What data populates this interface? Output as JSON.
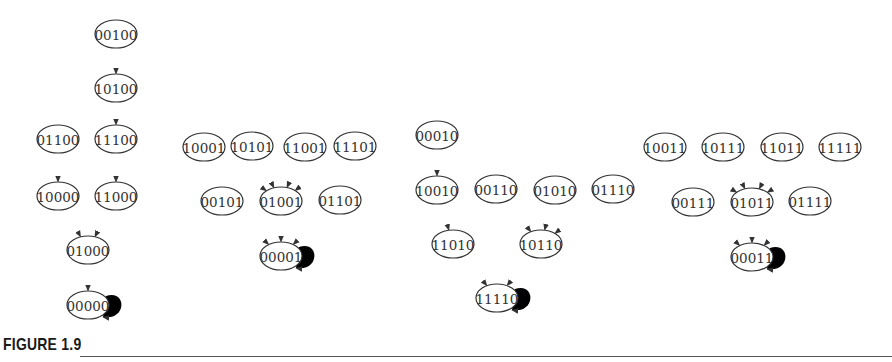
{
  "figure": {
    "caption": "FIGURE 1.9",
    "node_rx": 21,
    "node_ry": 14,
    "stroke_color": "#333333"
  },
  "graphs": [
    {
      "id": "g1",
      "attractor": "00000",
      "nodes": [
        {
          "id": "00100",
          "x": 116,
          "y": 34
        },
        {
          "id": "10100",
          "x": 116,
          "y": 88
        },
        {
          "id": "01100",
          "x": 58,
          "y": 139
        },
        {
          "id": "11100",
          "x": 116,
          "y": 139
        },
        {
          "id": "10000",
          "x": 58,
          "y": 196
        },
        {
          "id": "11000",
          "x": 116,
          "y": 196
        },
        {
          "id": "01000",
          "x": 88,
          "y": 250
        },
        {
          "id": "00000",
          "x": 88,
          "y": 305
        }
      ],
      "edges": [
        [
          "00100",
          "10100"
        ],
        [
          "10100",
          "11100"
        ],
        [
          "01100",
          "10000"
        ],
        [
          "11100",
          "11000"
        ],
        [
          "10000",
          "01000"
        ],
        [
          "11000",
          "01000"
        ],
        [
          "01000",
          "00000"
        ],
        [
          "00000",
          "00000"
        ]
      ]
    },
    {
      "id": "g2",
      "attractor": "00001",
      "nodes": [
        {
          "id": "10001",
          "x": 204,
          "y": 147
        },
        {
          "id": "10101",
          "x": 252,
          "y": 146
        },
        {
          "id": "11001",
          "x": 305,
          "y": 147
        },
        {
          "id": "11101",
          "x": 355,
          "y": 146
        },
        {
          "id": "00101",
          "x": 222,
          "y": 201
        },
        {
          "id": "01001",
          "x": 281,
          "y": 201
        },
        {
          "id": "01101",
          "x": 340,
          "y": 200
        },
        {
          "id": "00001",
          "x": 281,
          "y": 256
        }
      ],
      "edges": [
        [
          "10001",
          "01001"
        ],
        [
          "10101",
          "01001"
        ],
        [
          "11001",
          "01001"
        ],
        [
          "11101",
          "01001"
        ],
        [
          "00101",
          "00001"
        ],
        [
          "01001",
          "00001"
        ],
        [
          "01101",
          "00001"
        ],
        [
          "00001",
          "00001"
        ]
      ]
    },
    {
      "id": "g3",
      "attractor": "11110",
      "nodes": [
        {
          "id": "00010",
          "x": 437,
          "y": 135
        },
        {
          "id": "10010",
          "x": 437,
          "y": 190
        },
        {
          "id": "00110",
          "x": 496,
          "y": 189
        },
        {
          "id": "01010",
          "x": 555,
          "y": 190
        },
        {
          "id": "01110",
          "x": 613,
          "y": 189
        },
        {
          "id": "11010",
          "x": 453,
          "y": 244
        },
        {
          "id": "10110",
          "x": 541,
          "y": 244
        },
        {
          "id": "11110",
          "x": 497,
          "y": 298
        }
      ],
      "edges": [
        [
          "00010",
          "10010"
        ],
        [
          "10010",
          "11010"
        ],
        [
          "00110",
          "10110"
        ],
        [
          "01010",
          "10110"
        ],
        [
          "01110",
          "10110"
        ],
        [
          "11010",
          "11110"
        ],
        [
          "10110",
          "11110"
        ],
        [
          "11110",
          "11110"
        ]
      ]
    },
    {
      "id": "g4",
      "attractor": "00011",
      "nodes": [
        {
          "id": "10011",
          "x": 665,
          "y": 147
        },
        {
          "id": "10111",
          "x": 723,
          "y": 147
        },
        {
          "id": "11011",
          "x": 782,
          "y": 147
        },
        {
          "id": "11111",
          "x": 840,
          "y": 147
        },
        {
          "id": "00111",
          "x": 693,
          "y": 202
        },
        {
          "id": "01011",
          "x": 752,
          "y": 202
        },
        {
          "id": "01111",
          "x": 810,
          "y": 201
        },
        {
          "id": "00011",
          "x": 752,
          "y": 257
        }
      ],
      "edges": [
        [
          "10011",
          "01011"
        ],
        [
          "10111",
          "01011"
        ],
        [
          "11011",
          "01011"
        ],
        [
          "11111",
          "01011"
        ],
        [
          "00111",
          "00011"
        ],
        [
          "01011",
          "00011"
        ],
        [
          "01111",
          "00011"
        ],
        [
          "00011",
          "00011"
        ]
      ]
    }
  ]
}
